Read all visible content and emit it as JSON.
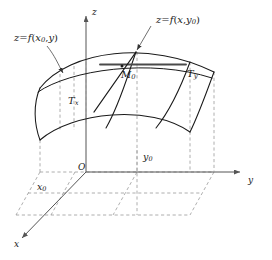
{
  "figure": {
    "colors": {
      "stroke": "#1a1a1a",
      "dashed": "#8a8a8a",
      "axis": "#555555",
      "tangent_y": "#4a4a4a",
      "background": "#ffffff",
      "text": "#1a1a1a"
    }
  },
  "labels": {
    "curve_x0": {
      "lhs": "z",
      "op": "=",
      "fn": "f",
      "arg1": "x",
      "arg1_sub": "0",
      "sep": ",",
      "arg2": "y"
    },
    "curve_y0": {
      "lhs": "z",
      "op": "=",
      "fn": "f",
      "arg1": "x",
      "sep": ",",
      "arg2": "y",
      "arg2_sub": "0"
    },
    "point": {
      "base": "M",
      "sub": "0"
    },
    "tangent_x": {
      "base": "T",
      "sub": "x"
    },
    "tangent_y": {
      "base": "T",
      "sub": "y"
    },
    "origin": "O",
    "axis_x": "x",
    "axis_y": "y",
    "axis_z": "z",
    "coord_x0": {
      "base": "x",
      "sub": "0"
    },
    "coord_y0": {
      "base": "y",
      "sub": "0"
    }
  }
}
